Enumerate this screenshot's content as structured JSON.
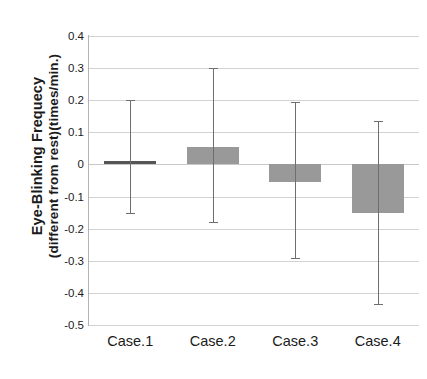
{
  "chart_data": {
    "type": "bar",
    "title": "",
    "xlabel": "",
    "ylabel": "Eye-Blinking Frequecy (different from rest)(times/min.)",
    "ylabel_line1": "Eye-Blinking Frequecy",
    "ylabel_line2": "(different from rest)(times/min.)",
    "categories": [
      "Case.1",
      "Case.2",
      "Case.3",
      "Case.4"
    ],
    "values": [
      0.012,
      0.055,
      -0.055,
      -0.15
    ],
    "error_low": [
      -0.15,
      -0.18,
      -0.29,
      -0.435
    ],
    "error_high": [
      0.2,
      0.3,
      0.195,
      0.135
    ],
    "bar_colors": [
      "#555555",
      "#999999",
      "#999999",
      "#999999"
    ],
    "ylim": [
      -0.5,
      0.4
    ],
    "ytick_values": [
      0.4,
      0.3,
      0.2,
      0.1,
      0,
      -0.1,
      -0.2,
      -0.3,
      -0.4,
      -0.5
    ],
    "ytick_labels": [
      "0.4",
      "0.3",
      "0.2",
      "0.1",
      "0",
      "-0.1",
      "-0.2",
      "-0.3",
      "-0.4",
      "-0.5"
    ],
    "grid": true,
    "grid_axis": "y",
    "legend": false,
    "legend_position": "none",
    "error_bar_color": "#6e6e6e",
    "gridline_color": "#d2d2d2"
  }
}
